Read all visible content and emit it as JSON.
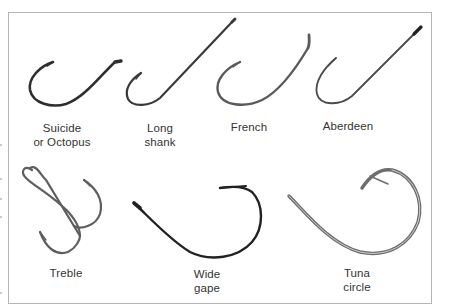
{
  "figure": {
    "hooks": [
      {
        "id": "suicide",
        "label_line1": "Suicide",
        "label_line2": "or Octopus"
      },
      {
        "id": "long-shank",
        "label_line1": "Long",
        "label_line2": "shank"
      },
      {
        "id": "french",
        "label_line1": "French",
        "label_line2": ""
      },
      {
        "id": "aberdeen",
        "label_line1": "Aberdeen",
        "label_line2": ""
      },
      {
        "id": "treble",
        "label_line1": "Treble",
        "label_line2": ""
      },
      {
        "id": "wide-gape",
        "label_line1": "Wide",
        "label_line2": "gape"
      },
      {
        "id": "tuna-circle",
        "label_line1": "Tuna",
        "label_line2": "circle"
      }
    ],
    "colors": {
      "hook_dark": "#2b2b2b",
      "hook_gray": "#6a6a6a",
      "frame": "#b5b5b5",
      "text": "#333333"
    }
  }
}
